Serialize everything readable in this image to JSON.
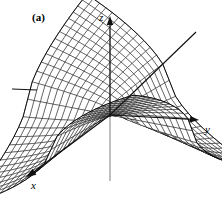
{
  "figure": {
    "panel_label": "(a)",
    "background_color": "#ffffff",
    "line_color": "#000000",
    "axis_color": "#111111",
    "axis_lower_color": "#8a8a8a",
    "width": 222,
    "height": 207
  },
  "axes": {
    "x_label": "x",
    "y_label": "y",
    "z_label": "z",
    "x_label_pos": {
      "x": 31,
      "y": 189
    },
    "y_label_pos": {
      "x": 205,
      "y": 133
    },
    "z_label_pos": {
      "x": 99,
      "y": 21
    },
    "origin": {
      "x": 110,
      "y": 115
    },
    "z_top": {
      "x": 110,
      "y": 16
    },
    "z_bottom": {
      "x": 110,
      "y": 181
    },
    "y_tip": {
      "x": 199,
      "y": 120
    },
    "y_neg_stub_start": {
      "x": 12,
      "y": 89
    },
    "y_neg_stub_end": {
      "x": 37,
      "y": 90
    },
    "x_tip": {
      "x": 26,
      "y": 177
    },
    "x_neg_tip": {
      "x": 196,
      "y": 32
    }
  },
  "chart_data": {
    "type": "surface",
    "title": "",
    "xlabel": "x",
    "ylabel": "y",
    "zlabel": "z",
    "surface_function": "z = |x*y| type saddle / cusped surface",
    "u_range": [
      -1,
      1
    ],
    "v_range": [
      -1,
      1
    ],
    "u_steps": 26,
    "v_steps": 26,
    "z_amplitude": 1.0,
    "projection": {
      "ex": {
        "dx": -1.02,
        "dy": 0.6
      },
      "ey": {
        "dx": 1.42,
        "dy": 0.27
      },
      "ez": {
        "dy": -1.0
      }
    },
    "scale": {
      "x": 58,
      "y": 58,
      "z": 86
    },
    "shading": "wireframe",
    "grid": false,
    "legend": false,
    "axis_ranges": {
      "x": [
        -1,
        1
      ],
      "y": [
        -1,
        1
      ],
      "z": [
        -1,
        1
      ]
    }
  }
}
